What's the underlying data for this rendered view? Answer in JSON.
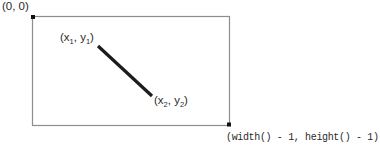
{
  "diagram": {
    "origin_label": "(0, 0)",
    "point1": {
      "pre": "(x",
      "sub1": "1",
      "mid": ", y",
      "sub2": "1",
      "post": ")"
    },
    "point2": {
      "pre": "(x",
      "sub1": "2",
      "mid": ", y",
      "sub2": "2",
      "post": ")"
    },
    "bottom_right_label": "(width() - 1, height() - 1)",
    "colors": {
      "border": "#8e8e8e",
      "line": "#1c1c1c",
      "marker": "#111111",
      "text": "#2a2a2a"
    }
  }
}
